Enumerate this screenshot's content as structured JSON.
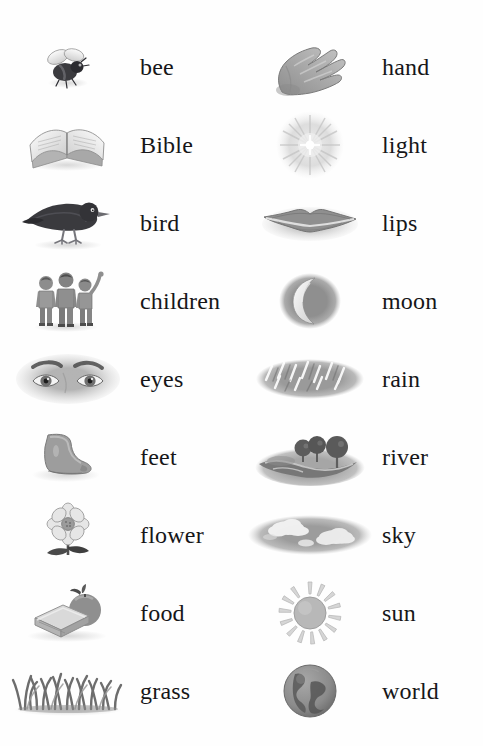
{
  "page": {
    "background_color": "#fefefe",
    "text_color": "#161618",
    "columns": 2,
    "rows_per_column": 9,
    "illustration_style": "grayscale pencil sketch"
  },
  "left_column": {
    "entries": [
      {
        "word": "bee",
        "icon": "bee-icon"
      },
      {
        "word": "Bible",
        "icon": "open-book-icon"
      },
      {
        "word": "bird",
        "icon": "bird-icon"
      },
      {
        "word": "children",
        "icon": "children-icon"
      },
      {
        "word": "eyes",
        "icon": "eyes-icon"
      },
      {
        "word": "feet",
        "icon": "foot-icon"
      },
      {
        "word": "flower",
        "icon": "flower-icon"
      },
      {
        "word": "food",
        "icon": "sandwich-and-apple-icon"
      },
      {
        "word": "grass",
        "icon": "grass-icon"
      }
    ]
  },
  "right_column": {
    "entries": [
      {
        "word": "hand",
        "icon": "hand-icon"
      },
      {
        "word": "light",
        "icon": "light-burst-icon"
      },
      {
        "word": "lips",
        "icon": "lips-icon"
      },
      {
        "word": "moon",
        "icon": "crescent-moon-icon"
      },
      {
        "word": "rain",
        "icon": "rain-icon"
      },
      {
        "word": "river",
        "icon": "river-with-trees-icon"
      },
      {
        "word": "sky",
        "icon": "sky-with-clouds-icon"
      },
      {
        "word": "sun",
        "icon": "sun-icon"
      },
      {
        "word": "world",
        "icon": "globe-icon"
      }
    ]
  }
}
